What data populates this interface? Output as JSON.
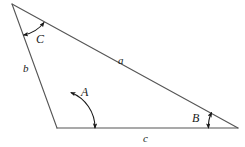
{
  "figure": {
    "kind": "geometry-diagram",
    "shape": "triangle",
    "background_color": "#ffffff",
    "stroke_color": "#555555",
    "arc_color": "#1a1a1a",
    "text_color": "#1a1a1a"
  },
  "vertices": {
    "top": {
      "name": "C-vertex",
      "x": 12,
      "y": 4
    },
    "bottom_left": {
      "name": "A-vertex",
      "x": 57,
      "y": 128
    },
    "bottom_right": {
      "name": "B-vertex",
      "x": 238,
      "y": 128
    }
  },
  "sides": [
    {
      "id": "a",
      "label": "a",
      "from": "top",
      "to": "bottom_right",
      "label_x": 118,
      "label_y": 55
    },
    {
      "id": "b",
      "label": "b",
      "from": "top",
      "to": "bottom_left",
      "label_x": 23,
      "label_y": 63
    },
    {
      "id": "c",
      "label": "c",
      "from": "bottom_left",
      "to": "bottom_right",
      "label_x": 143,
      "label_y": 133
    }
  ],
  "angles": [
    {
      "id": "A",
      "label": "A",
      "at_vertex": "bottom_left",
      "arc_radius": 38,
      "label_x": 81,
      "label_y": 86,
      "arrowheads": "both"
    },
    {
      "id": "B",
      "label": "B",
      "at_vertex": "bottom_right",
      "arc_radius": 30,
      "label_x": 192,
      "label_y": 112,
      "arrowheads": "both"
    },
    {
      "id": "C",
      "label": "C",
      "at_vertex": "top",
      "arc_radius": 33,
      "label_x": 36,
      "label_y": 33,
      "arrowheads": "both"
    }
  ]
}
